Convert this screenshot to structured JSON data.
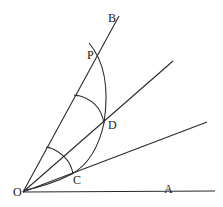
{
  "diagram": {
    "type": "geometric-construction",
    "points": {
      "O": {
        "label": "O",
        "x": 23,
        "y": 192
      },
      "A": {
        "label": "A",
        "x": 215,
        "y": 191
      },
      "B": {
        "label": "B",
        "x": 119,
        "y": 16
      },
      "P": {
        "label": "P",
        "x": 98,
        "y": 57
      },
      "D": {
        "label": "D",
        "x": 104,
        "y": 123
      },
      "C": {
        "label": "C",
        "x": 72,
        "y": 174
      }
    },
    "labels": {
      "O": "O",
      "A": "A",
      "B": "B",
      "P": "P",
      "D": "D",
      "C": "C"
    },
    "rays": [
      "OA",
      "OB",
      "OD (extended)",
      "OC (extended)"
    ],
    "arcs": [
      "arc through P, D, C",
      "arc centered O near C",
      "arc centered O near D"
    ]
  }
}
